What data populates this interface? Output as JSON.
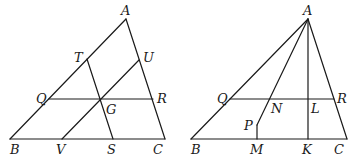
{
  "figures": [
    {
      "name": "left-triangle",
      "labels": {
        "A": "A",
        "B": "B",
        "C": "C",
        "T": "T",
        "U": "U",
        "Q": "Q",
        "R": "R",
        "G": "G",
        "V": "V",
        "S": "S"
      },
      "segments": [
        "AB",
        "AC",
        "BC",
        "QR",
        "TS",
        "UV"
      ]
    },
    {
      "name": "right-triangle",
      "labels": {
        "A": "A",
        "B": "B",
        "C": "C",
        "Q": "Q",
        "R": "R",
        "N": "N",
        "L": "L",
        "P": "P",
        "M": "M",
        "K": "K"
      },
      "segments": [
        "AB",
        "AC",
        "BC",
        "QR",
        "AK",
        "AP",
        "PM"
      ]
    }
  ]
}
